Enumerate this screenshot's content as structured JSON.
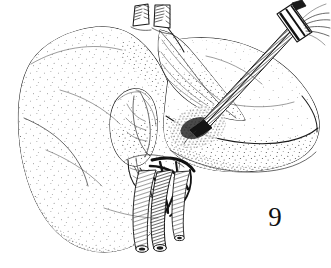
{
  "figure": {
    "number_label": "9",
    "caption_text": "",
    "medium": "pen-and-ink stipple drawing",
    "background_color": "#ffffff",
    "ink_color": "#1a1a1a",
    "width_px": 331,
    "height_px": 268
  },
  "structures": {
    "liver": {
      "name": "liver",
      "left_lobe_label": "left hepatic lobe",
      "right_lobe_label": "right hepatic lobe",
      "shading": "stipple"
    },
    "gallbladder": {
      "name": "gallbladder",
      "position": "central, inferior surface"
    },
    "hepatic_vein_stumps": {
      "name": "hepatic vein stumps",
      "count": 2,
      "position": "superior margin"
    },
    "portal_triad": {
      "name": "portal triad",
      "vessels": [
        "portal vein",
        "hepatic artery",
        "common bile duct"
      ],
      "count": 3,
      "position": "hepatic hilum, inferior"
    },
    "instrument": {
      "name": "cannula",
      "description": "surgical cannula with cross-bar handle inserted into liver parenchyma",
      "entry_point": "right lobe anterior surface",
      "angle": "upper right to lower left"
    },
    "falciform_ligament": {
      "name": "falciform ligament",
      "position": "between lobes, superior"
    }
  }
}
